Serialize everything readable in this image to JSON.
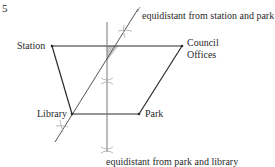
{
  "question_number": "5",
  "points": {
    "station": {
      "label": "Station",
      "x": 52,
      "y": 46
    },
    "council": {
      "label": "Council\nOffices",
      "x": 182,
      "y": 46
    },
    "library": {
      "label": "Library",
      "x": 72,
      "y": 114
    },
    "park": {
      "label": "Park",
      "x": 139,
      "y": 114
    }
  },
  "annotations": {
    "bisector_station_park": "equidistant from station and park",
    "bisector_park_library": "equidistant from park and library"
  },
  "labels": {
    "station": "Station",
    "council_line1": "Council",
    "council_line2": "Offices",
    "library": "Library",
    "park": "Park"
  },
  "colors": {
    "outline": "#2a2a2a",
    "construction": "#777777",
    "arc": "#aaaaaa",
    "shade": "#cccccc"
  }
}
